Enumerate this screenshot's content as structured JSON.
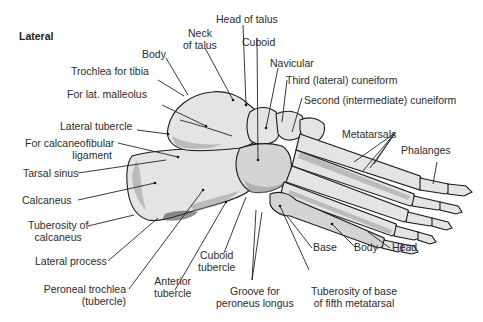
{
  "figure": {
    "view_title": "Lateral",
    "labels": {
      "head_of_talus": "Head of talus",
      "neck_of_talus": [
        "Neck",
        "of talus"
      ],
      "body": "Body",
      "cuboid": "Cuboid",
      "navicular": "Navicular",
      "trochlea_for_tibia": "Trochlea for tibia",
      "third_cuneiform": "Third (lateral) cuneiform",
      "for_lat_malleolus": "For lat. malleolus",
      "second_cuneiform": "Second (intermediate) cuneiform",
      "lateral_tubercle": "Lateral tubercle",
      "metatarsals": "Metatarsals",
      "for_calcaneofibular": [
        "For calcaneofibular",
        "ligament"
      ],
      "phalanges": "Phalanges",
      "tarsal_sinus": "Tarsal sinus",
      "calcaneus": "Calcaneus",
      "tuberosity_of_calcaneus": [
        "Tuberosity of",
        "calcaneus"
      ],
      "lateral_process": "Lateral process",
      "peroneal_trochlea": [
        "Peroneal trochlea",
        "(tubercle)"
      ],
      "anterior_tubercle": [
        "Anterior",
        "tubercle"
      ],
      "cuboid_tubercle": [
        "Cuboid",
        "tubercle"
      ],
      "groove_for_peroneus_longus": [
        "Groove for",
        "peroneus longus"
      ],
      "base": "Base",
      "metatarsal_body": "Body",
      "metatarsal_head": "Head",
      "tuberosity_fifth_metatarsal": [
        "Tuberosity of base",
        "of fifth metatarsal"
      ]
    }
  },
  "colors": {
    "background": "#ffffff",
    "text": "#2b2b2b",
    "bone_fill": "#e4e4e4",
    "outline": "#1a1a1a"
  }
}
